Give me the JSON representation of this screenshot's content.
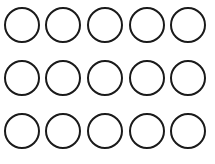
{
  "figure": {
    "rows": 3,
    "columns": 5,
    "total_circles": 15,
    "circle_diameter": 36,
    "stroke_width": 2,
    "stroke_color": "#1a1a1a",
    "fill_color": "#ffffff",
    "background_color": "#ffffff",
    "column_centers_x": [
      22,
      63,
      105,
      147,
      188
    ],
    "row_centers_y": [
      25,
      78,
      131
    ]
  }
}
